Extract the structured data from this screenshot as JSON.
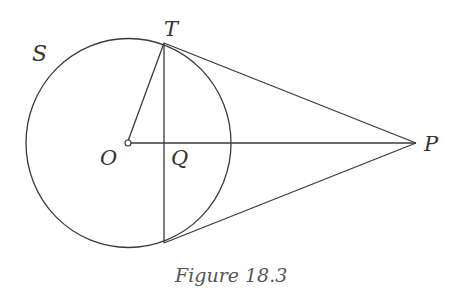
{
  "figure": {
    "caption": "Figure 18.3",
    "labels": {
      "circle": "S",
      "center": "O",
      "tangent_point": "T",
      "chord_midpoint": "Q",
      "external_point": "P"
    },
    "colors": {
      "stroke": "#3a3a3a",
      "text": "#333333",
      "caption": "#555555",
      "background": "#ffffff"
    }
  }
}
